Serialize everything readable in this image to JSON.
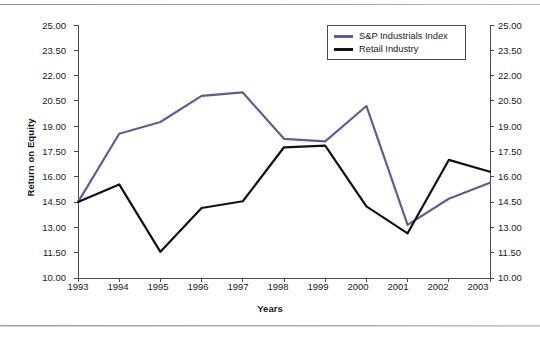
{
  "chart_data": {
    "type": "line",
    "title": "",
    "xlabel": "Years",
    "ylabel": "Return on Equity",
    "categories": [
      "1993",
      "1994",
      "1995",
      "1996",
      "1997",
      "1998",
      "1999",
      "2000",
      "2001",
      "2002",
      "2003"
    ],
    "x": [
      1993,
      1994,
      1995,
      1996,
      1997,
      1998,
      1999,
      2000,
      2001,
      2002,
      2003
    ],
    "ylim": [
      10.0,
      25.0
    ],
    "ytick_step": 1.5,
    "ytick_labels": [
      "25.00",
      "23.50",
      "22.00",
      "20.50",
      "19.00",
      "17.50",
      "16.00",
      "14.50",
      "13.00",
      "11.50",
      "10.00"
    ],
    "ytick_values": [
      25.0,
      23.5,
      22.0,
      20.5,
      19.0,
      17.5,
      16.0,
      14.5,
      13.0,
      11.5,
      10.0
    ],
    "dual_axis": true,
    "right_axis_same_as_left": true,
    "grid": false,
    "legend_position": "top-right",
    "series": [
      {
        "name": "S&P Industrials Index",
        "color": "#5a5f96",
        "values": [
          14.5,
          18.55,
          19.25,
          20.8,
          21.0,
          18.25,
          18.1,
          20.2,
          13.15,
          14.7,
          15.65
        ]
      },
      {
        "name": "Retail Industry",
        "color": "#111111",
        "values": [
          14.5,
          15.55,
          11.55,
          14.15,
          14.55,
          17.75,
          17.85,
          14.25,
          12.65,
          17.0,
          16.3
        ]
      }
    ]
  },
  "axes": {
    "y_label": "Return on Equity",
    "x_label": "Years"
  },
  "legend": {
    "items": [
      {
        "label": "S&P Industrials Index",
        "color": "#5a5f96"
      },
      {
        "label": "Retail Industry",
        "color": "#111111"
      }
    ]
  },
  "colors": {
    "sp_line": "#5a5f96",
    "retail_line": "#111111",
    "axis": "#4a4a4a",
    "text": "#1a1a1a",
    "background": "#ffffff"
  }
}
